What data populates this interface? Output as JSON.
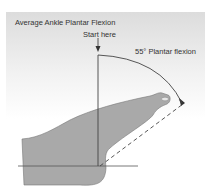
{
  "diagram": {
    "title": "Average Ankle Plantar Flexion",
    "start_label": "Start here",
    "angle_label": "55° Plantar flexion",
    "angle_degrees": 55,
    "colors": {
      "foot_fill": "#a9a9a9",
      "line": "#333333",
      "background_top": "#dcdcdc",
      "background_bottom": "#ffffff"
    }
  }
}
